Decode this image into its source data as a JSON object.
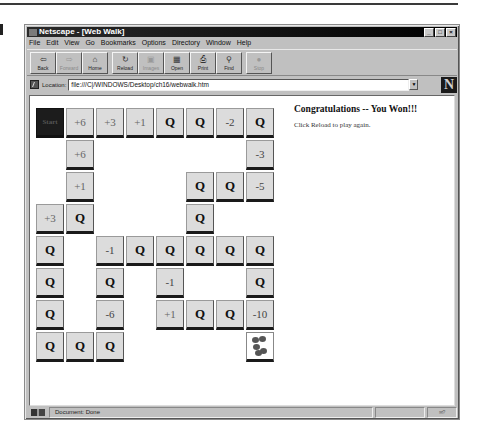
{
  "window": {
    "title": "Netscape - [Web Walk]",
    "controls": [
      "_",
      "□",
      "×"
    ]
  },
  "menu": [
    "File",
    "Edit",
    "View",
    "Go",
    "Bookmarks",
    "Options",
    "Directory",
    "Window",
    "Help"
  ],
  "toolbar": {
    "buttons": [
      {
        "label": "Back",
        "icon": "back-arrow-icon",
        "glyph": "⇦",
        "enabled": true
      },
      {
        "label": "Forward",
        "icon": "forward-arrow-icon",
        "glyph": "⇨",
        "enabled": false
      },
      {
        "label": "Home",
        "icon": "home-icon",
        "glyph": "⌂",
        "enabled": true
      },
      {
        "label": "Reload",
        "icon": "reload-icon",
        "glyph": "↻",
        "enabled": true
      },
      {
        "label": "Images",
        "icon": "images-icon",
        "glyph": "▣",
        "enabled": false
      },
      {
        "label": "Open",
        "icon": "open-icon",
        "glyph": "▦",
        "enabled": true
      },
      {
        "label": "Print",
        "icon": "print-icon",
        "glyph": "⎙",
        "enabled": true
      },
      {
        "label": "Find",
        "icon": "find-icon",
        "glyph": "⚲",
        "enabled": true
      },
      {
        "label": "Stop",
        "icon": "stop-icon",
        "glyph": "●",
        "enabled": false
      }
    ]
  },
  "location": {
    "label": "Location:",
    "url": "file:///C|/WINDOWS/Desktop/ch16/webwalk.htm"
  },
  "game": {
    "rows": [
      [
        "Start",
        "+6",
        "+3",
        "+1",
        "Q",
        "Q",
        "-2",
        "Q"
      ],
      [
        "",
        "+6",
        "",
        "",
        "",
        "",
        "",
        "-3"
      ],
      [
        "",
        "+1",
        "",
        "",
        "",
        "Q",
        "Q",
        "-5"
      ],
      [
        "+3",
        "Q",
        "",
        "",
        "",
        "Q",
        "",
        ""
      ],
      [
        "Q",
        "",
        "-1",
        "Q",
        "Q",
        "Q",
        "Q",
        "Q"
      ],
      [
        "Q",
        "",
        "Q",
        "",
        "-1",
        "",
        "",
        "Q"
      ],
      [
        "Q",
        "",
        "-6",
        "",
        "+1",
        "Q",
        "Q",
        "-10"
      ],
      [
        "Q",
        "Q",
        "Q",
        "",
        "",
        "",
        "",
        "FINISH"
      ]
    ],
    "finish_icon": "paw-prints-icon"
  },
  "message": {
    "title": "Congratulations -- You Won!!!",
    "subtitle": "Click Reload to play again."
  },
  "status": {
    "text": "Document: Done"
  }
}
